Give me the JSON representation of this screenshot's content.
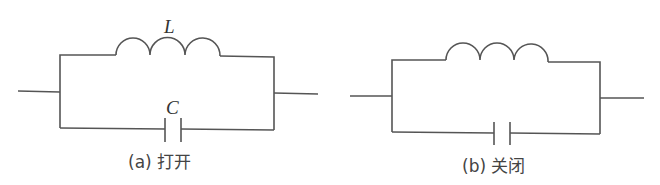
{
  "figure": {
    "panels": [
      {
        "id": "a",
        "inductor_label": "L",
        "capacitor_label": "C",
        "caption": "(a) 打开"
      },
      {
        "id": "b",
        "inductor_label": "",
        "capacitor_label": "",
        "caption": "(b) 关闭"
      }
    ],
    "colors": {
      "wire": "#555555",
      "text": "#333333",
      "background": "#ffffff"
    }
  }
}
